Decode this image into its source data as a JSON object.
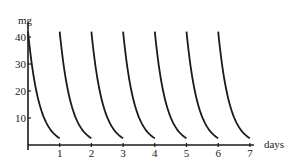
{
  "chart_data": {
    "type": "line",
    "title": "",
    "xlabel": "days",
    "ylabel": "mg",
    "xlim": [
      0,
      7
    ],
    "ylim": [
      0,
      45
    ],
    "x_ticks": [
      "1",
      "2",
      "3",
      "4",
      "5",
      "6",
      "7"
    ],
    "y_ticks": [
      "10",
      "20",
      "30",
      "40"
    ],
    "grid": false,
    "legend": null,
    "series": [
      {
        "name": "day 0",
        "x": [
          0,
          0.25,
          0.5,
          0.75,
          1.0
        ],
        "y": [
          42,
          20,
          10,
          5,
          2.5
        ]
      },
      {
        "name": "day 1",
        "x": [
          1,
          1.25,
          1.5,
          1.75,
          2.0
        ],
        "y": [
          42,
          20,
          10,
          5,
          2.5
        ]
      },
      {
        "name": "day 2",
        "x": [
          2,
          2.25,
          2.5,
          2.75,
          3.0
        ],
        "y": [
          42,
          20,
          10,
          5,
          2.5
        ]
      },
      {
        "name": "day 3",
        "x": [
          3,
          3.25,
          3.5,
          3.75,
          4.0
        ],
        "y": [
          42,
          20,
          10,
          5,
          2.5
        ]
      },
      {
        "name": "day 4",
        "x": [
          4,
          4.25,
          4.5,
          4.75,
          5.0
        ],
        "y": [
          42,
          20,
          10,
          5,
          2.5
        ]
      },
      {
        "name": "day 5",
        "x": [
          5,
          5.25,
          5.5,
          5.75,
          6.0
        ],
        "y": [
          42,
          20,
          10,
          5,
          2.5
        ]
      },
      {
        "name": "day 6",
        "x": [
          6,
          6.25,
          6.5,
          6.75,
          7.0
        ],
        "y": [
          42,
          20,
          10,
          5,
          2.5
        ]
      }
    ],
    "colors": {
      "line": "#1a1a1a",
      "axis": "#1a1a1a"
    }
  }
}
